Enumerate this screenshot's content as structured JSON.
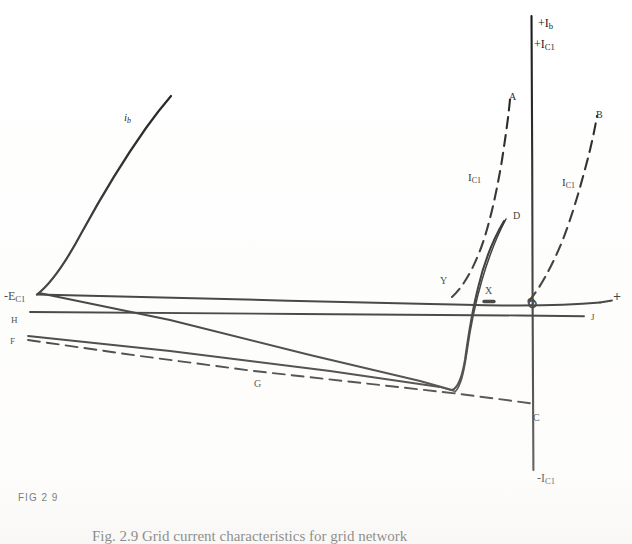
{
  "figure": {
    "number_label": "FIG 2 9",
    "caption": "Fig. 2.9    Grid current characteristics for grid network",
    "title_alt": "Grid current characteristics"
  },
  "axes": {
    "vertical_top_primary": "+I",
    "vertical_top_primary_sub": "b",
    "vertical_top_secondary": "+I",
    "vertical_top_secondary_sub": "C1",
    "vertical_bottom": "-I",
    "vertical_bottom_sub": "C1",
    "horizontal_right_plus": "+",
    "horizontal_left": "-E",
    "horizontal_left_sub": "C1",
    "origin_marker": "O"
  },
  "curve_labels": [
    {
      "id": "ib",
      "text": "i",
      "sub": "b",
      "x": 124,
      "y": 112,
      "italic": true,
      "size": 11
    },
    {
      "id": "A",
      "text": "A",
      "sub": "",
      "x": 509,
      "y": 92,
      "italic": false,
      "size": 10
    },
    {
      "id": "B",
      "text": "B",
      "sub": "",
      "x": 596,
      "y": 110,
      "italic": false,
      "size": 10
    },
    {
      "id": "D",
      "text": "D",
      "sub": "",
      "x": 513,
      "y": 211,
      "italic": false,
      "size": 10
    },
    {
      "id": "C",
      "text": "C",
      "sub": "",
      "x": 533,
      "y": 413,
      "italic": false,
      "size": 10
    },
    {
      "id": "G",
      "text": "G",
      "sub": "",
      "x": 254,
      "y": 379,
      "italic": false,
      "size": 10
    },
    {
      "id": "H",
      "text": "H",
      "sub": "",
      "x": 11,
      "y": 316,
      "italic": false,
      "size": 9
    },
    {
      "id": "F",
      "text": "F",
      "sub": "",
      "x": 10,
      "y": 337,
      "italic": false,
      "size": 9
    },
    {
      "id": "J",
      "text": "J",
      "sub": "",
      "x": 591,
      "y": 313,
      "italic": false,
      "size": 9
    },
    {
      "id": "X",
      "text": "X",
      "sub": "",
      "x": 485,
      "y": 286,
      "italic": false,
      "size": 10
    },
    {
      "id": "Y",
      "text": "Y",
      "sub": "",
      "x": 440,
      "y": 276,
      "italic": false,
      "size": 10
    },
    {
      "id": "IC1-A",
      "text": "I",
      "sub": "C1",
      "x": 468,
      "y": 172,
      "italic": false,
      "size": 11
    },
    {
      "id": "IC1-B",
      "text": "I",
      "sub": "C1",
      "x": 562,
      "y": 177,
      "italic": false,
      "size": 11
    }
  ],
  "chart_data": {
    "type": "line",
    "title": "Grid current characteristics",
    "xlabel": "Grid voltage",
    "ylabel": "Current",
    "grid": false,
    "legend_position": "inline-annotations",
    "origin_px": {
      "x": 532,
      "y": 297
    },
    "series": [
      {
        "name": "i_b",
        "style": "solid",
        "label": "i_b",
        "description": "Anode current: exponential rise from cut-off vertex at left toward upper-left region",
        "points_px": [
          [
            37,
            295
          ],
          [
            48,
            283
          ],
          [
            62,
            262
          ],
          [
            78,
            234
          ],
          [
            95,
            205
          ],
          [
            112,
            178
          ],
          [
            130,
            151
          ],
          [
            148,
            126
          ],
          [
            162,
            108
          ],
          [
            170,
            98
          ]
        ]
      },
      {
        "name": "I_C1-A",
        "style": "dashed",
        "label": "I_C1",
        "description": "Dashed grid-current curve A rising steeply just left of the current axis",
        "points_px": [
          [
            459,
            296
          ],
          [
            470,
            280
          ],
          [
            480,
            258
          ],
          [
            489,
            230
          ],
          [
            496,
            196
          ],
          [
            502,
            158
          ],
          [
            507,
            122
          ],
          [
            510,
            100
          ]
        ]
      },
      {
        "name": "I_C1-B",
        "style": "dashed",
        "label": "I_C1",
        "description": "Dashed grid-current curve B rising to the right of the origin",
        "points_px": [
          [
            530,
            300
          ],
          [
            543,
            278
          ],
          [
            556,
            250
          ],
          [
            568,
            214
          ],
          [
            579,
            176
          ],
          [
            588,
            140
          ],
          [
            595,
            118
          ]
        ]
      },
      {
        "name": "D",
        "style": "solid",
        "label": "D",
        "description": "Solid steep characteristic crossing the axis near X and rising to D",
        "points_px": [
          [
            455,
            392
          ],
          [
            462,
            362
          ],
          [
            470,
            330
          ],
          [
            480,
            300
          ],
          [
            490,
            268
          ],
          [
            500,
            240
          ],
          [
            508,
            222
          ]
        ]
      },
      {
        "name": "load-line-upper",
        "style": "solid",
        "label": "",
        "description": "Straight load line from left vertex sloping gently down to the right through X and O",
        "points_px": [
          [
            37,
            295
          ],
          [
            200,
            299
          ],
          [
            400,
            303
          ],
          [
            532,
            306
          ],
          [
            586,
            308
          ]
        ]
      },
      {
        "name": "load-line-H",
        "style": "solid",
        "label": "H",
        "description": "Horizontal reference line H extending right to J",
        "points_px": [
          [
            30,
            312
          ],
          [
            300,
            314
          ],
          [
            580,
            316
          ]
        ]
      },
      {
        "name": "load-line-F",
        "style": "solid",
        "label": "F",
        "description": "Line F sloping downward to the right toward the solid curve minimum",
        "points_px": [
          [
            28,
            336
          ],
          [
            180,
            352
          ],
          [
            330,
            372
          ],
          [
            440,
            389
          ],
          [
            455,
            392
          ]
        ]
      },
      {
        "name": "G-dashed",
        "style": "dashed",
        "label": "G",
        "description": "Long dashed line sloping down from left, passing G and crossing the axis at C",
        "points_px": [
          [
            28,
            340
          ],
          [
            150,
            358
          ],
          [
            254,
            372
          ],
          [
            380,
            386
          ],
          [
            460,
            394
          ],
          [
            532,
            404
          ]
        ]
      },
      {
        "name": "descending-solid",
        "style": "solid",
        "label": "",
        "description": "Solid line descending from the left vertex region to the curve minimum near C",
        "points_px": [
          [
            40,
            293
          ],
          [
            160,
            318
          ],
          [
            300,
            352
          ],
          [
            420,
            382
          ],
          [
            455,
            392
          ]
        ]
      }
    ],
    "marked_points": [
      {
        "label": "O",
        "px": [
          532,
          300
        ],
        "note": "origin"
      },
      {
        "label": "X",
        "px": [
          489,
          299
        ],
        "note": "intersection on horizontal axis"
      },
      {
        "label": "Y",
        "px": [
          452,
          296
        ],
        "note": "intersection of dashed curve A with axis"
      },
      {
        "label": "C",
        "px": [
          529,
          404
        ],
        "note": "dashed line G crossing negative current axis"
      }
    ]
  }
}
